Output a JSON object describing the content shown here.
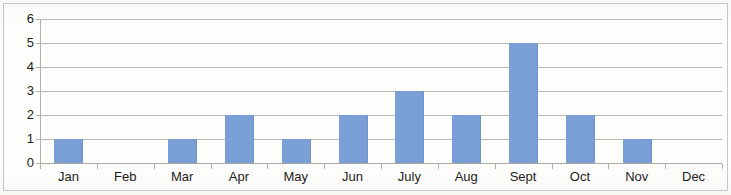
{
  "chart_data": {
    "type": "bar",
    "title": "",
    "xlabel": "",
    "ylabel": "",
    "categories": [
      "Jan",
      "Feb",
      "Mar",
      "Apr",
      "May",
      "Jun",
      "July",
      "Aug",
      "Sept",
      "Oct",
      "Nov",
      "Dec"
    ],
    "values": [
      1,
      0,
      1,
      2,
      1,
      2,
      3,
      2,
      5,
      2,
      1,
      0
    ],
    "ylim": [
      0,
      6
    ],
    "y_ticks": [
      0,
      1,
      2,
      3,
      4,
      5,
      6
    ],
    "y_tick_labels": [
      "0",
      "1",
      "2",
      "3",
      "4",
      "5",
      "6"
    ],
    "grid": true,
    "grid_axis": "y",
    "legend": false,
    "legend_position": "none",
    "series": [
      {
        "name": "",
        "values": [
          1,
          0,
          1,
          2,
          1,
          2,
          3,
          2,
          5,
          2,
          1,
          0
        ],
        "color": "#7a9ed6"
      }
    ],
    "colors": {
      "bar": "#7a9ed6",
      "gridline": "#b8b8b4",
      "axis": "#b0b0ac",
      "text": "#1c1c1c",
      "background": "#fefefc",
      "border": "#c9c9c4"
    }
  }
}
